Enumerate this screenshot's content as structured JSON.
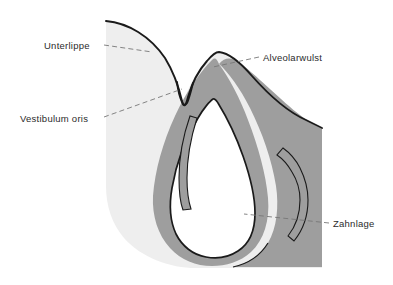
{
  "figure": {
    "background_color": "#ffffff",
    "outline_color": "#1a1a1a",
    "leader_color": "#777777",
    "label_color": "#2b2b2b"
  },
  "regions": [
    {
      "key": "soft_tissue",
      "name": "Weichteil / Unterlippe und Alveolarwulst",
      "fill": "#eeeeee"
    },
    {
      "key": "bone",
      "name": "Knochen / Zahnsaeckchen",
      "fill": "#9e9e9e"
    },
    {
      "key": "tooth_germ",
      "name": "Zahnanlage (Schmelzorgan)",
      "fill": "#ffffff"
    }
  ],
  "labels": [
    {
      "id": "unterlippe",
      "text": "Unterlippe",
      "x": 44,
      "y": 49,
      "anchor": "start",
      "side": "left"
    },
    {
      "id": "vestibulum-oris",
      "text": "Vestibulum oris",
      "x": 20,
      "y": 122,
      "anchor": "start",
      "side": "left"
    },
    {
      "id": "alveolarwulst",
      "text": "Alveolarwulst",
      "x": 263,
      "y": 61,
      "anchor": "start",
      "side": "right"
    },
    {
      "id": "zahnlage",
      "text": "Zahnlage",
      "x": 333,
      "y": 227,
      "anchor": "start",
      "side": "right"
    }
  ]
}
